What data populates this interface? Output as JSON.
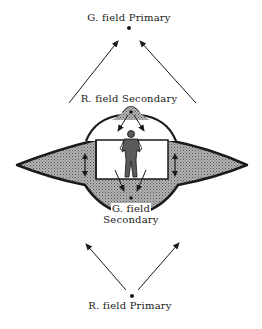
{
  "diagram": {
    "labels": {
      "g_field_primary": "G. field Primary",
      "r_field_secondary": "R. field Secondary",
      "g_field_secondary_line1": "G. field",
      "g_field_secondary_line2": "Secondary",
      "r_field_primary": "R. field Primary"
    },
    "colors": {
      "ink": "#1a1a1a",
      "hull_fill": "#a8a8a8",
      "background": "#ffffff"
    }
  }
}
